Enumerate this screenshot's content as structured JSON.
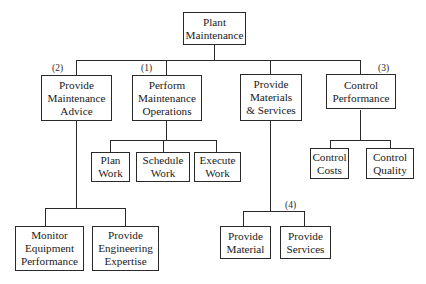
{
  "diagram": {
    "type": "hierarchy",
    "root": {
      "label": "Plant\nMaintenance"
    },
    "level1": [
      {
        "id": "advice",
        "label": "Provide\nMaintenance\nAdvice",
        "tag": "(2)",
        "children": [
          {
            "label": "Monitor\nEquipment\nPerformance"
          },
          {
            "label": "Provide\nEngineering\nExpertise"
          }
        ]
      },
      {
        "id": "operations",
        "label": "Perform\nMaintenance\nOperations",
        "tag": "(1)",
        "children": [
          {
            "label": "Plan\nWork"
          },
          {
            "label": "Schedule\nWork"
          },
          {
            "label": "Execute\nWork"
          }
        ]
      },
      {
        "id": "materials",
        "label": "Provide\nMaterials\n& Services",
        "tag": "(4)",
        "children": [
          {
            "label": "Provide\nMaterial"
          },
          {
            "label": "Provide\nServices"
          }
        ]
      },
      {
        "id": "control",
        "label": "Control\nPerformance",
        "tag": "(3)",
        "children": [
          {
            "label": "Control\nCosts"
          },
          {
            "label": "Control\nQuality"
          }
        ]
      }
    ]
  }
}
